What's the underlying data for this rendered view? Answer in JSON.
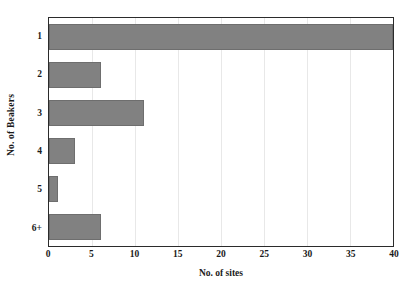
{
  "chart_data": {
    "type": "bar",
    "orientation": "horizontal",
    "title": "",
    "xlabel": "No. of sites",
    "ylabel": "No. of Beakers",
    "categories": [
      "1",
      "2",
      "3",
      "4",
      "5",
      "6+"
    ],
    "values": [
      40,
      6,
      11,
      3,
      1,
      6
    ],
    "xlim": [
      0,
      40
    ],
    "xticks": [
      "0",
      "5",
      "10",
      "15",
      "20",
      "25",
      "30",
      "35",
      "40"
    ],
    "xtick_values": [
      0,
      5,
      10,
      15,
      20,
      25,
      30,
      35,
      40
    ],
    "grid": "faint vertical gridlines",
    "legend": "none",
    "series": [
      {
        "name": "No. of sites",
        "values": [
          40,
          6,
          11,
          3,
          1,
          6
        ]
      }
    ]
  },
  "style": {
    "bar_color": "#818181",
    "bar_edge_color": "#6e6e6e",
    "axis_color": "#2b2b2b",
    "background": "#ffffff",
    "gridline_color": "#e8e8e8",
    "text_color": "#1a1a1a"
  }
}
